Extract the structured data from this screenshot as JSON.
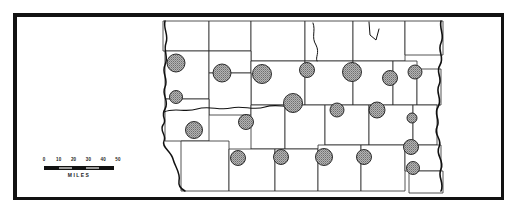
{
  "figure": {
    "type": "proportional-symbol-county-map",
    "frame_color": "#121212",
    "background": "#ffffff"
  },
  "scale": {
    "caption": "MILES",
    "unit": "miles",
    "min": 0,
    "max": 50,
    "tick_labels": [
      "0",
      "10",
      "20",
      "30",
      "40",
      "50"
    ],
    "segment_fills": [
      "#111111",
      "#9a9a9a",
      "#111111",
      "#9a9a9a",
      "#111111"
    ]
  },
  "symbol_legend": {
    "shape": "circle",
    "fill": "stippled-gray",
    "fill_color": "#a8a8a8",
    "outline_color": "#1b1b1b",
    "meaning": "proportional quantity per county"
  },
  "map": {
    "county_line_color": "#2a2a2a",
    "river_line_color": "#111111",
    "counties": [
      {
        "id": "c01",
        "cx": 176,
        "cy": 63,
        "r": 9.0
      },
      {
        "id": "c02",
        "cx": 222,
        "cy": 73,
        "r": 9.0
      },
      {
        "id": "c03",
        "cx": 262,
        "cy": 74,
        "r": 9.5
      },
      {
        "id": "c04",
        "cx": 307,
        "cy": 70,
        "r": 7.5
      },
      {
        "id": "c05",
        "cx": 352,
        "cy": 72,
        "r": 9.5
      },
      {
        "id": "c06",
        "cx": 390,
        "cy": 78,
        "r": 7.5
      },
      {
        "id": "c07",
        "cx": 415,
        "cy": 72,
        "r": 7.0
      },
      {
        "id": "c08",
        "cx": 176,
        "cy": 97,
        "r": 6.5
      },
      {
        "id": "c09",
        "cx": 246,
        "cy": 122,
        "r": 7.5
      },
      {
        "id": "c10",
        "cx": 293,
        "cy": 103,
        "r": 9.5
      },
      {
        "id": "c11",
        "cx": 337,
        "cy": 110,
        "r": 7.0
      },
      {
        "id": "c12",
        "cx": 377,
        "cy": 110,
        "r": 8.0
      },
      {
        "id": "c13",
        "cx": 412,
        "cy": 118,
        "r": 5.0
      },
      {
        "id": "c14",
        "cx": 194,
        "cy": 130,
        "r": 8.5
      },
      {
        "id": "c15",
        "cx": 238,
        "cy": 158,
        "r": 7.5
      },
      {
        "id": "c16",
        "cx": 281,
        "cy": 157,
        "r": 7.5
      },
      {
        "id": "c17",
        "cx": 324,
        "cy": 157,
        "r": 8.5
      },
      {
        "id": "c18",
        "cx": 364,
        "cy": 157,
        "r": 7.5
      },
      {
        "id": "c19",
        "cx": 411,
        "cy": 147,
        "r": 7.5
      },
      {
        "id": "c20",
        "cx": 413,
        "cy": 168,
        "r": 6.5
      }
    ]
  }
}
